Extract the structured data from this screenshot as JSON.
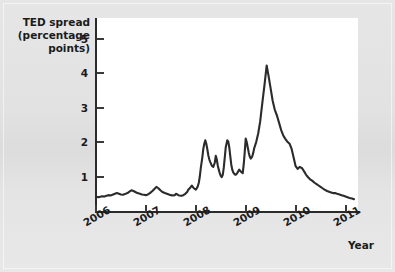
{
  "chart_data": {
    "type": "line",
    "title": "",
    "ylabel": "TED spread\n(percentage\npoints)",
    "ylabel_lines": [
      "TED spread",
      "(percentage",
      "points)"
    ],
    "xlabel": "Year",
    "ylim": [
      0,
      5.6
    ],
    "xlim": [
      2006.0,
      2011.25
    ],
    "yticks": [
      1,
      2,
      3,
      4,
      5
    ],
    "ytick_labels": [
      "1",
      "2",
      "3",
      "4",
      "5"
    ],
    "xticks": [
      2006,
      2007,
      2008,
      2009,
      2010,
      2011
    ],
    "xtick_labels": [
      "2006",
      "2007",
      "2008",
      "2009",
      "2010",
      "2011"
    ],
    "grid": false,
    "legend": null,
    "line_color": "#2b2b2b",
    "plot_background": "#ffffff",
    "figure_background": "#e3e3e3",
    "series": [
      {
        "name": "TED spread",
        "x": [
          2006.0,
          2006.04,
          2006.08,
          2006.12,
          2006.17,
          2006.21,
          2006.25,
          2006.29,
          2006.33,
          2006.38,
          2006.42,
          2006.46,
          2006.5,
          2006.54,
          2006.58,
          2006.63,
          2006.67,
          2006.71,
          2006.75,
          2006.79,
          2006.83,
          2006.88,
          2006.92,
          2006.96,
          2007.0,
          2007.04,
          2007.08,
          2007.13,
          2007.17,
          2007.21,
          2007.25,
          2007.29,
          2007.33,
          2007.38,
          2007.42,
          2007.46,
          2007.5,
          2007.54,
          2007.58,
          2007.6,
          2007.63,
          2007.65,
          2007.67,
          2007.71,
          2007.75,
          2007.79,
          2007.83,
          2007.85,
          2007.88,
          2007.9,
          2007.92,
          2007.94,
          2007.96,
          2007.98,
          2008.0,
          2008.02,
          2008.04,
          2008.06,
          2008.08,
          2008.1,
          2008.13,
          2008.15,
          2008.17,
          2008.19,
          2008.21,
          2008.23,
          2008.25,
          2008.27,
          2008.29,
          2008.31,
          2008.33,
          2008.35,
          2008.38,
          2008.4,
          2008.42,
          2008.44,
          2008.46,
          2008.48,
          2008.5,
          2008.52,
          2008.54,
          2008.56,
          2008.58,
          2008.6,
          2008.63,
          2008.65,
          2008.67,
          2008.69,
          2008.71,
          2008.73,
          2008.75,
          2008.77,
          2008.79,
          2008.81,
          2008.83,
          2008.85,
          2008.87,
          2008.88,
          2008.9,
          2008.92,
          2008.94,
          2008.96,
          2008.98,
          2009.0,
          2009.02,
          2009.04,
          2009.06,
          2009.08,
          2009.1,
          2009.13,
          2009.15,
          2009.17,
          2009.21,
          2009.25,
          2009.29,
          2009.33,
          2009.38,
          2009.42,
          2009.46,
          2009.5,
          2009.54,
          2009.58,
          2009.63,
          2009.67,
          2009.71,
          2009.75,
          2009.79,
          2009.83,
          2009.88,
          2009.92,
          2009.96,
          2010.0,
          2010.04,
          2010.08,
          2010.13,
          2010.17,
          2010.21,
          2010.25,
          2010.29,
          2010.33,
          2010.38,
          2010.42,
          2010.46,
          2010.5,
          2010.54,
          2010.58,
          2010.63,
          2010.67,
          2010.71,
          2010.75,
          2010.79,
          2010.83,
          2010.88,
          2010.92,
          2010.96,
          2011.0,
          2011.04,
          2011.08,
          2011.13,
          2011.17
        ],
        "y": [
          0.42,
          0.4,
          0.41,
          0.43,
          0.42,
          0.44,
          0.46,
          0.45,
          0.47,
          0.5,
          0.52,
          0.5,
          0.48,
          0.47,
          0.49,
          0.52,
          0.56,
          0.6,
          0.58,
          0.55,
          0.52,
          0.5,
          0.48,
          0.47,
          0.46,
          0.48,
          0.52,
          0.58,
          0.64,
          0.7,
          0.66,
          0.6,
          0.55,
          0.52,
          0.5,
          0.48,
          0.46,
          0.45,
          0.46,
          0.5,
          0.48,
          0.46,
          0.45,
          0.44,
          0.46,
          0.5,
          0.56,
          0.62,
          0.66,
          0.7,
          0.74,
          0.7,
          0.66,
          0.64,
          0.62,
          0.66,
          0.72,
          0.82,
          1.0,
          1.25,
          1.55,
          1.8,
          1.95,
          2.05,
          1.95,
          1.8,
          1.62,
          1.5,
          1.42,
          1.35,
          1.3,
          1.28,
          1.4,
          1.6,
          1.5,
          1.32,
          1.2,
          1.1,
          1.02,
          0.98,
          1.05,
          1.25,
          1.55,
          1.85,
          2.05,
          2.02,
          1.85,
          1.6,
          1.35,
          1.2,
          1.12,
          1.08,
          1.05,
          1.06,
          1.1,
          1.15,
          1.2,
          1.18,
          1.15,
          1.12,
          1.1,
          1.35,
          1.7,
          2.1,
          2.0,
          1.85,
          1.7,
          1.58,
          1.52,
          1.58,
          1.68,
          1.82,
          2.0,
          2.25,
          2.6,
          3.1,
          3.7,
          4.22,
          3.9,
          3.55,
          3.2,
          2.95,
          2.75,
          2.55,
          2.35,
          2.2,
          2.1,
          2.02,
          1.95,
          1.8,
          1.55,
          1.3,
          1.22,
          1.28,
          1.24,
          1.15,
          1.05,
          0.98,
          0.92,
          0.88,
          0.82,
          0.78,
          0.74,
          0.7,
          0.66,
          0.62,
          0.58,
          0.56,
          0.54,
          0.52,
          0.52,
          0.5,
          0.48,
          0.46,
          0.44,
          0.42,
          0.4,
          0.38,
          0.36,
          0.34
        ],
        "y_comment": "values in percentage points"
      }
    ],
    "series_note": "Additional fine-grained oscillations included in y array; curve shows pre-crisis baseline ~0.4-0.5 in 2006-mid2007, first spike ~2.0 in Aug 2007 and early 2008, sustained volatility ~1.0-2.1 through 2008, major peak of ~4.2 in Oct 2008, gradual decline through 2009, low ~0.3-0.5 in 2010-2011 with a small bump ~0.5 in mid 2010"
  },
  "figure": {
    "y_axis_title_lines": [
      "TED spread",
      "(percentage",
      "points)"
    ],
    "x_axis_title": "Year"
  }
}
